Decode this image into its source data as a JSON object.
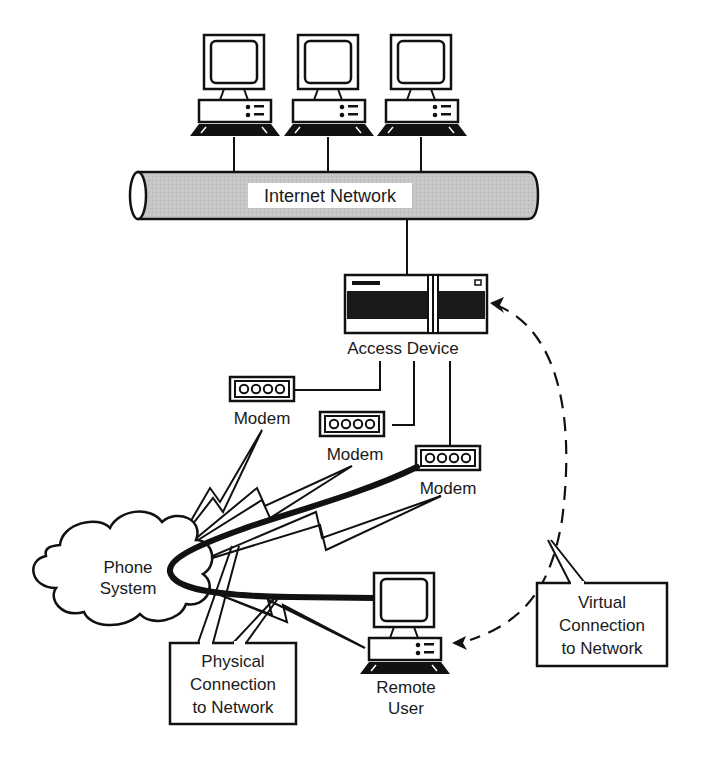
{
  "diagram": {
    "type": "network-topology",
    "colors": {
      "stroke": "#111111",
      "background": "#ffffff",
      "tube_fill": "#c4c4c4",
      "label_bg": "#ffffff"
    },
    "nodes": {
      "pc_1": {
        "label": ""
      },
      "pc_2": {
        "label": ""
      },
      "pc_3": {
        "label": ""
      },
      "internet": {
        "label": "Internet Network"
      },
      "access_device": {
        "label": "Access Device"
      },
      "modem_1": {
        "label": "Modem",
        "glyph": "OOOO"
      },
      "modem_2": {
        "label": "Modem",
        "glyph": "OOOO"
      },
      "modem_3": {
        "label": "Modem",
        "glyph": "OOOO"
      },
      "phone_system": {
        "label_line1": "Phone",
        "label_line2": "System"
      },
      "remote_user": {
        "label_line1": "Remote",
        "label_line2": "User"
      }
    },
    "callouts": {
      "physical": {
        "line1": "Physical",
        "line2": "Connection",
        "line3": "to Network"
      },
      "virtual": {
        "line1": "Virtual",
        "line2": "Connection",
        "line3": "to Network"
      }
    },
    "edges": [
      {
        "from": "pc_1",
        "to": "internet",
        "style": "solid"
      },
      {
        "from": "pc_2",
        "to": "internet",
        "style": "solid"
      },
      {
        "from": "pc_3",
        "to": "internet",
        "style": "solid"
      },
      {
        "from": "internet",
        "to": "access_device",
        "style": "solid"
      },
      {
        "from": "access_device",
        "to": "modem_1",
        "style": "solid"
      },
      {
        "from": "access_device",
        "to": "modem_2",
        "style": "solid"
      },
      {
        "from": "access_device",
        "to": "modem_3",
        "style": "solid"
      },
      {
        "from": "modem_1",
        "to": "phone_system",
        "style": "lightning"
      },
      {
        "from": "modem_2",
        "to": "phone_system",
        "style": "lightning"
      },
      {
        "from": "modem_3",
        "to": "phone_system",
        "style": "lightning"
      },
      {
        "from": "phone_system",
        "to": "remote_user",
        "style": "lightning"
      },
      {
        "from": "modem_3",
        "to": "remote_user",
        "style": "thick-curve",
        "via": "phone_system"
      },
      {
        "from": "remote_user",
        "to": "access_device",
        "style": "dashed-arrow"
      }
    ]
  }
}
